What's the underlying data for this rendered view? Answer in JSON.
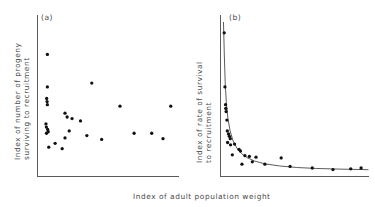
{
  "figure": {
    "background_color": "#ffffff",
    "axis_color": "#5b5b5b",
    "point_color": "#111111",
    "curve_color": "#4a4a4a",
    "shared_xlabel": "Index of adult population weight"
  },
  "chart_data": [
    {
      "type": "scatter",
      "panel_label": "(a)",
      "title": "",
      "xlabel": "Index of adult population weight",
      "ylabel": "Index of number of progeny surviving to recruitment",
      "xlim": [
        0,
        100
      ],
      "ylim": [
        0,
        100
      ],
      "grid": false,
      "legend": "none",
      "axes": "left-and-bottom-spines",
      "points": [
        {
          "x": 7.0,
          "y": 79.0
        },
        {
          "x": 38.5,
          "y": 60.5
        },
        {
          "x": 7.0,
          "y": 58.0
        },
        {
          "x": 6.5,
          "y": 50.5
        },
        {
          "x": 6.8,
          "y": 48.5
        },
        {
          "x": 7.0,
          "y": 46.5
        },
        {
          "x": 58.5,
          "y": 45.5
        },
        {
          "x": 94.5,
          "y": 45.5
        },
        {
          "x": 19.5,
          "y": 41.0
        },
        {
          "x": 21.0,
          "y": 38.5
        },
        {
          "x": 24.5,
          "y": 37.5
        },
        {
          "x": 30.5,
          "y": 36.0
        },
        {
          "x": 6.0,
          "y": 34.0
        },
        {
          "x": 6.3,
          "y": 32.0
        },
        {
          "x": 7.2,
          "y": 30.5
        },
        {
          "x": 7.6,
          "y": 29.0
        },
        {
          "x": 6.4,
          "y": 28.0
        },
        {
          "x": 22.5,
          "y": 29.5
        },
        {
          "x": 19.5,
          "y": 25.0
        },
        {
          "x": 35.0,
          "y": 26.5
        },
        {
          "x": 45.5,
          "y": 24.0
        },
        {
          "x": 68.5,
          "y": 28.0
        },
        {
          "x": 81.0,
          "y": 28.0
        },
        {
          "x": 89.0,
          "y": 24.5
        },
        {
          "x": 8.0,
          "y": 19.0
        },
        {
          "x": 17.5,
          "y": 18.0
        },
        {
          "x": 12.5,
          "y": 21.5
        }
      ]
    },
    {
      "type": "scatter",
      "panel_label": "(b)",
      "title": "",
      "xlabel": "Index of adult population weight",
      "ylabel": "Index of rate of survival to recruitment",
      "xlim": [
        0,
        100
      ],
      "ylim": [
        0,
        100
      ],
      "grid": false,
      "legend": "none",
      "axes": "left-and-bottom-spines",
      "fit_curve": {
        "form": "hyperbolic-decay",
        "description": "steeply falling curve approaching a low asymptote",
        "points": [
          {
            "x": 2.0,
            "y": 100.0
          },
          {
            "x": 2.6,
            "y": 78.0
          },
          {
            "x": 3.2,
            "y": 60.0
          },
          {
            "x": 4.0,
            "y": 47.0
          },
          {
            "x": 5.0,
            "y": 37.5
          },
          {
            "x": 6.5,
            "y": 29.5
          },
          {
            "x": 8.5,
            "y": 23.0
          },
          {
            "x": 11.0,
            "y": 18.5
          },
          {
            "x": 14.0,
            "y": 15.0
          },
          {
            "x": 18.0,
            "y": 12.2
          },
          {
            "x": 23.0,
            "y": 10.0
          },
          {
            "x": 30.0,
            "y": 8.2
          },
          {
            "x": 40.0,
            "y": 6.8
          },
          {
            "x": 52.0,
            "y": 5.8
          },
          {
            "x": 65.0,
            "y": 5.2
          },
          {
            "x": 80.0,
            "y": 4.8
          },
          {
            "x": 100.0,
            "y": 4.4
          }
        ]
      },
      "points": [
        {
          "x": 2.5,
          "y": 93.0
        },
        {
          "x": 3.0,
          "y": 58.0
        },
        {
          "x": 3.4,
          "y": 46.5
        },
        {
          "x": 3.6,
          "y": 44.0
        },
        {
          "x": 3.8,
          "y": 42.0
        },
        {
          "x": 4.3,
          "y": 36.5
        },
        {
          "x": 4.6,
          "y": 29.5
        },
        {
          "x": 5.4,
          "y": 27.5
        },
        {
          "x": 6.0,
          "y": 26.0
        },
        {
          "x": 6.6,
          "y": 24.5
        },
        {
          "x": 4.8,
          "y": 22.0
        },
        {
          "x": 6.8,
          "y": 20.5
        },
        {
          "x": 9.5,
          "y": 21.0
        },
        {
          "x": 12.5,
          "y": 17.5
        },
        {
          "x": 13.5,
          "y": 16.5
        },
        {
          "x": 8.0,
          "y": 14.0
        },
        {
          "x": 16.5,
          "y": 13.5
        },
        {
          "x": 19.5,
          "y": 13.0
        },
        {
          "x": 24.0,
          "y": 12.5
        },
        {
          "x": 21.5,
          "y": 9.5
        },
        {
          "x": 14.5,
          "y": 8.0
        },
        {
          "x": 30.0,
          "y": 8.0
        },
        {
          "x": 41.0,
          "y": 12.0
        },
        {
          "x": 47.0,
          "y": 6.5
        },
        {
          "x": 62.0,
          "y": 5.5
        },
        {
          "x": 76.0,
          "y": 4.5
        },
        {
          "x": 88.0,
          "y": 5.0
        },
        {
          "x": 95.0,
          "y": 5.5
        }
      ]
    }
  ]
}
